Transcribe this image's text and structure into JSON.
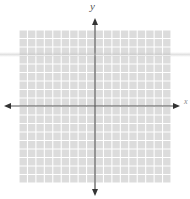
{
  "figure": {
    "type": "coordinate-plane",
    "x_axis_label": "x",
    "y_axis_label": "y",
    "grid": {
      "columns": 18,
      "rows": 18,
      "left": 19,
      "top": 30,
      "right": 171,
      "bottom": 183,
      "cell_fill": "#dcdcdc",
      "line_color": "#ffffff"
    },
    "axes": {
      "origin_x": 95,
      "origin_y": 106,
      "color": "#555555",
      "x_arrow_left": 4,
      "x_arrow_right": 180,
      "y_arrow_top": 18,
      "y_arrow_bottom": 196,
      "arrows": "both-ends"
    }
  }
}
